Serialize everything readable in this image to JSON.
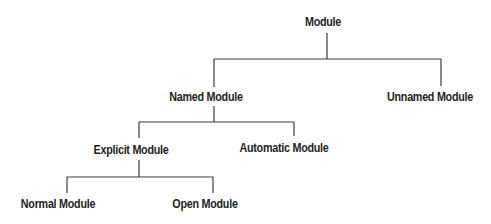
{
  "diagram": {
    "type": "tree",
    "nodes": {
      "root": {
        "label": "Module",
        "x": 323,
        "y": 22
      },
      "named": {
        "label": "Named Module",
        "x": 206,
        "y": 97
      },
      "unnamed": {
        "label": "Unnamed Module",
        "x": 430,
        "y": 97
      },
      "explicit": {
        "label": "Explicit Module",
        "x": 131,
        "y": 150
      },
      "automatic": {
        "label": "Automatic Module",
        "x": 284,
        "y": 148
      },
      "normal": {
        "label": "Normal Module",
        "x": 58,
        "y": 204
      },
      "open": {
        "label": "Open Module",
        "x": 205,
        "y": 204
      }
    },
    "edges": [
      {
        "from": "Module",
        "to": "Named Module"
      },
      {
        "from": "Module",
        "to": "Unnamed Module"
      },
      {
        "from": "Named Module",
        "to": "Explicit Module"
      },
      {
        "from": "Named Module",
        "to": "Automatic Module"
      },
      {
        "from": "Explicit Module",
        "to": "Normal Module"
      },
      {
        "from": "Explicit Module",
        "to": "Open Module"
      }
    ],
    "line_color": "#3a3a3a",
    "text_color": "#1e1e1e"
  }
}
